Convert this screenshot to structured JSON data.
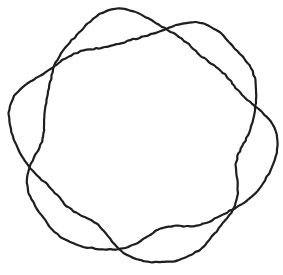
{
  "figure": {
    "background_color": "#ffffff",
    "stroke_color": "#1e1e1e",
    "stroke_width": 2.2,
    "canvas": {
      "width": 283,
      "height": 275
    },
    "center": {
      "x": 143,
      "y": 137
    }
  },
  "chart_data": {
    "type": "line",
    "xlabel": "",
    "ylabel": "",
    "grid": false,
    "legend": "none",
    "xlim": [
      0,
      283
    ],
    "ylim": [
      0,
      275
    ],
    "parametric": {
      "model": "r(t) = r0 + a*cos(3*(t - phase))",
      "center_x": 143,
      "center_y": 137,
      "lobes": 3
    },
    "series": [
      {
        "name": "loop-a",
        "r0": 112,
        "amplitude": 16,
        "phase_deg": 18,
        "closed": true,
        "color": "#1e1e1e"
      },
      {
        "name": "loop-b",
        "r0": 112,
        "amplitude": 16,
        "phase_deg": 78,
        "closed": true,
        "color": "#1e1e1e"
      }
    ],
    "crossings": [
      {
        "label": "top-left",
        "x": 64,
        "y": 55
      },
      {
        "label": "top",
        "x": 138,
        "y": 25
      },
      {
        "label": "top-right",
        "x": 218,
        "y": 60
      },
      {
        "label": "right",
        "x": 246,
        "y": 140
      },
      {
        "label": "bottom-right",
        "x": 212,
        "y": 222
      },
      {
        "label": "bottom",
        "x": 148,
        "y": 248
      },
      {
        "label": "bottom-left",
        "x": 65,
        "y": 207
      },
      {
        "label": "left",
        "x": 37,
        "y": 135
      }
    ],
    "extents": {
      "top_y": 13,
      "bottom_y": 262,
      "left_x": 18,
      "right_x": 268
    }
  }
}
